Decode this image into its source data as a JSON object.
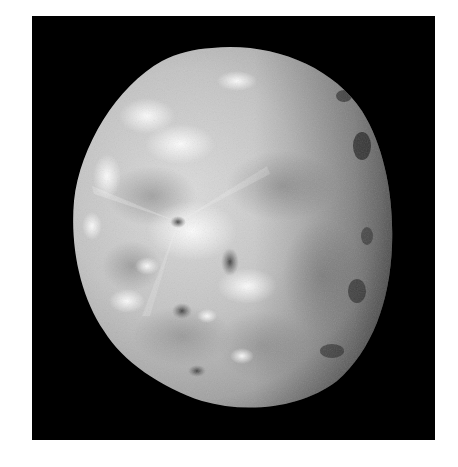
{
  "image": {
    "subject": "moon-photograph",
    "description": "Grayscale photograph of a cratered moon, gibbous phase, against black space",
    "background_color": "#000000",
    "page_color": "#ffffff",
    "surface_colors": {
      "bright": "#f4f4f4",
      "mid": "#b8b8b8",
      "dark": "#5a5a5a",
      "terminator": "#2a2a2a"
    }
  }
}
